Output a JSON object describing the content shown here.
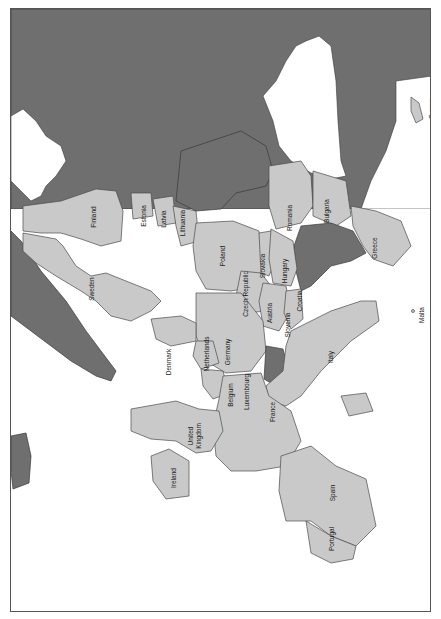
{
  "map": {
    "title": "",
    "orientation": "rotated 90 degrees (north to the left)",
    "colors": {
      "member": "#c9c9c9",
      "non_member": "#6f6f6f",
      "water": "#ffffff",
      "border": "#4a4a4a"
    },
    "labels": {
      "finland": "Finland",
      "sweden": "Sweden",
      "estonia": "Estonia",
      "latvia": "Latvia",
      "lithuania": "Lithuania",
      "poland": "Poland",
      "romania": "Romania",
      "bulgaria": "Bulgaria",
      "greece": "Greece",
      "slovakia": "Slovakia",
      "hungary": "Hungary",
      "czech_republic": "Czech Republic",
      "austria": "Austria",
      "slovenia": "Slovenia",
      "croatia": "Croatia",
      "germany": "Germany",
      "netherlands": "Netherlands",
      "denmark": "Denmark",
      "belgium": "Belgium",
      "luxembourg": "Luxembourg",
      "france": "France",
      "italy": "Italy",
      "malta": "Malta",
      "cyprus": "Cyprus",
      "united_kingdom_line1": "United",
      "united_kingdom_line2": "Kingdom",
      "ireland": "Ireland",
      "spain": "Spain",
      "portugal": "Portugal"
    }
  }
}
